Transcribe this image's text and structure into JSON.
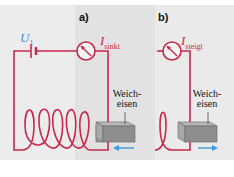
{
  "panels": [
    {
      "id": "a",
      "label": "a)",
      "voltage": {
        "symbol": "U",
        "subscript": "1"
      },
      "current": {
        "symbol": "I",
        "subscript": "sinkt"
      },
      "iron_label": {
        "line1": "Weich-",
        "line2": "eisen"
      },
      "motion_direction": "left"
    },
    {
      "id": "b",
      "label": "b)",
      "current": {
        "symbol": "I",
        "subscript": "steigt"
      },
      "iron_label": {
        "line1": "Weich-",
        "line2": "eisen"
      },
      "motion_direction": "right"
    }
  ],
  "colors": {
    "wire": "#c8284a",
    "voltage_label": "#4a8fc8",
    "arrow": "#3a9ad8",
    "iron": "#8a8a8a"
  }
}
